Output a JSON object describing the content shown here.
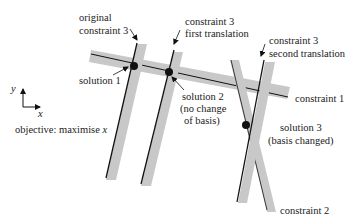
{
  "diagram": {
    "colors": {
      "band": "#c8c8c8",
      "line": "#111111",
      "text": "#222222",
      "background": "#ffffff"
    },
    "labels": {
      "original_c3_l1": "original",
      "original_c3_l2": "constraint 3",
      "c3_first_l1": "constraint 3",
      "c3_first_l2": "first translation",
      "c3_second_l1": "constraint 3",
      "c3_second_l2": "second translation",
      "constraint1": "constraint 1",
      "constraint2": "constraint 2",
      "solution1": "solution 1",
      "solution2_l1": "solution 2",
      "solution2_l2": "(no change",
      "solution2_l3": "of basis)",
      "solution3_l1": "solution 3",
      "solution3_l2": "(basis changed)",
      "axis_y": "y",
      "axis_x": "x",
      "objective_prefix": "objective: maximise ",
      "objective_var": "x"
    },
    "nodes": [
      {
        "id": "solution1",
        "x": 134,
        "y": 66
      },
      {
        "id": "solution2",
        "x": 169,
        "y": 72
      },
      {
        "id": "solution3",
        "x": 246,
        "y": 125
      }
    ]
  }
}
